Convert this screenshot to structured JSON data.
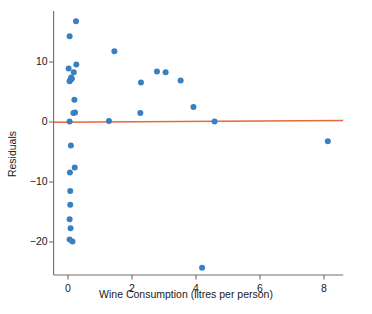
{
  "chart_data": {
    "type": "scatter",
    "title": "",
    "xlabel": "Wine Consumption (litres per person)",
    "ylabel": "Residuals",
    "xlim": [
      -0.45,
      8.6
    ],
    "ylim": [
      -25.5,
      18.5
    ],
    "xticks": [
      0,
      2,
      4,
      6,
      8
    ],
    "xtick_labels": [
      "0",
      "2",
      "4",
      "6",
      "8"
    ],
    "yticks": [
      10,
      0,
      -10,
      -20
    ],
    "ytick_labels": [
      "10",
      "0",
      "−10",
      "−20"
    ],
    "grid": false,
    "legend": null,
    "marker_color": "#3a7fbf",
    "marker_size": 3.0,
    "series": [
      {
        "name": "Residuals",
        "points": [
          [
            0.25,
            16.8
          ],
          [
            0.05,
            14.3
          ],
          [
            1.45,
            11.8
          ],
          [
            0.26,
            9.6
          ],
          [
            0.02,
            8.9
          ],
          [
            0.18,
            8.3
          ],
          [
            0.1,
            7.4
          ],
          [
            0.12,
            7.2
          ],
          [
            0.07,
            7.0
          ],
          [
            0.05,
            6.8
          ],
          [
            2.78,
            8.4
          ],
          [
            3.05,
            8.3
          ],
          [
            2.28,
            6.6
          ],
          [
            3.52,
            6.9
          ],
          [
            0.2,
            3.7
          ],
          [
            0.22,
            1.6
          ],
          [
            0.17,
            1.5
          ],
          [
            3.92,
            2.5
          ],
          [
            2.26,
            1.5
          ],
          [
            0.05,
            0.1
          ],
          [
            1.28,
            0.15
          ],
          [
            4.58,
            0.1
          ],
          [
            0.09,
            -3.9
          ],
          [
            0.21,
            -7.6
          ],
          [
            0.06,
            -8.4
          ],
          [
            0.07,
            -11.5
          ],
          [
            0.07,
            -13.8
          ],
          [
            0.05,
            -16.2
          ],
          [
            0.08,
            -17.7
          ],
          [
            0.05,
            -19.6
          ],
          [
            0.14,
            -19.9
          ],
          [
            8.12,
            -3.2
          ],
          [
            4.19,
            -24.3
          ]
        ]
      }
    ],
    "reference_line": {
      "name": "zero-residual-fit-line",
      "color": "#e8673c",
      "y_at_xmin": -0.05,
      "y_at_xmax": 0.25,
      "width": 1.6
    }
  }
}
